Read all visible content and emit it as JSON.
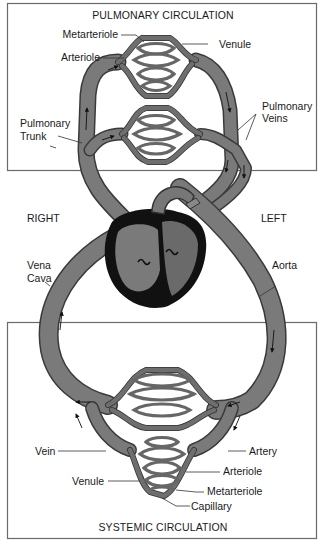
{
  "diagram": {
    "type": "circulatory-system",
    "titles": {
      "pulmonary": "PULMONARY CIRCULATION",
      "systemic": "SYSTEMIC CIRCULATION"
    },
    "sides": {
      "right": "RIGHT",
      "left": "LEFT"
    },
    "pulmonary_labels": {
      "metarteriole": "Metarteriole",
      "venule": "Venule",
      "arteriole": "Arteriole",
      "pulmonary_trunk_1": "Pulmonary",
      "pulmonary_trunk_2": "Trunk",
      "pulmonary_veins_1": "Pulmonary",
      "pulmonary_veins_2": "Veins"
    },
    "great_vessel_labels": {
      "vena_cava_1": "Vena",
      "vena_cava_2": "Cava",
      "aorta": "Aorta"
    },
    "systemic_labels": {
      "vein": "Vein",
      "artery": "Artery",
      "arteriole": "Arteriole",
      "venule": "Venule",
      "metarteriole": "Metarteriole",
      "capillary": "Capillary"
    },
    "colors": {
      "vessel": "#7a7a7a",
      "vessel_outline": "#3a3a3a",
      "heart_wall": "#111111",
      "background": "#ffffff",
      "box_border": "#6a6a6a"
    }
  }
}
